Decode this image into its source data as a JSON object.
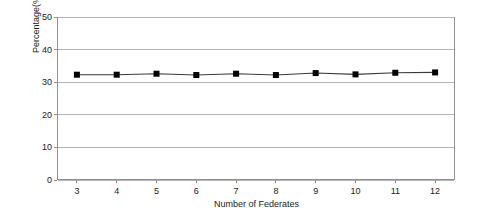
{
  "chart_data": {
    "type": "line",
    "title": "",
    "xlabel": "Number of Federates",
    "ylabel": "Percentage(%)",
    "x": [
      3,
      4,
      5,
      6,
      7,
      8,
      9,
      10,
      11,
      12
    ],
    "xticklabels": [
      "3",
      "4",
      "5",
      "6",
      "7",
      "8",
      "9",
      "10",
      "11",
      "12"
    ],
    "yticklabels": [
      "0",
      "10",
      "20",
      "30",
      "40",
      "50"
    ],
    "yticks": [
      0,
      10,
      20,
      30,
      40,
      50
    ],
    "xlim": [
      2.5,
      12.5
    ],
    "ylim": [
      0,
      50
    ],
    "grid": "horizontal",
    "legend": "none",
    "series": [
      {
        "name": "Percentage",
        "marker": "square",
        "marker_color": "#000000",
        "line_color": "#3a3a3a",
        "values": [
          32.3,
          32.3,
          32.6,
          32.2,
          32.6,
          32.2,
          32.8,
          32.4,
          32.9,
          33.0
        ]
      }
    ]
  },
  "axes": {
    "plot_left_px": 57,
    "plot_top_px": 17,
    "plot_width_px": 398,
    "plot_height_px": 163,
    "border_color": "#8f8f8f",
    "gridline_color": "#b5b5b5",
    "background": "#ffffff"
  }
}
